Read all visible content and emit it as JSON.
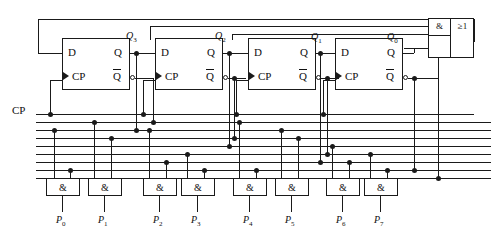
{
  "diagram": {
    "clock_label": "CP",
    "flipflops": [
      {
        "name": "ff-q3",
        "d_label": "D",
        "q_label": "Q",
        "cp_label": "CP",
        "qbar_label": "Q",
        "output_label": "Q",
        "output_sub": "3",
        "x": 62,
        "y": 38,
        "w": 68,
        "h": 52
      },
      {
        "name": "ff-q2",
        "d_label": "D",
        "q_label": "Q",
        "cp_label": "CP",
        "qbar_label": "Q",
        "output_label": "Q",
        "output_sub": "2",
        "x": 155,
        "y": 38,
        "w": 68,
        "h": 52
      },
      {
        "name": "ff-q1",
        "d_label": "D",
        "q_label": "Q",
        "cp_label": "CP",
        "qbar_label": "Q",
        "output_label": "Q",
        "output_sub": "1",
        "x": 248,
        "y": 38,
        "w": 68,
        "h": 52
      },
      {
        "name": "ff-q0",
        "d_label": "D",
        "q_label": "Q",
        "cp_label": "CP",
        "qbar_label": "Q",
        "output_label": "Q",
        "output_sub": "0",
        "x": 335,
        "y": 38,
        "w": 68,
        "h": 52
      }
    ],
    "feedback_gate": {
      "and_symbol": "&",
      "or_symbol": "≥1",
      "x": 428,
      "y": 18,
      "w": 46,
      "h": 40
    },
    "decoder_gates": [
      {
        "symbol": "&",
        "output_label": "P",
        "output_sub": "0",
        "x": 46,
        "y": 178,
        "w": 34,
        "h": 18
      },
      {
        "symbol": "&",
        "output_label": "P",
        "output_sub": "1",
        "x": 88,
        "y": 178,
        "w": 34,
        "h": 18
      },
      {
        "symbol": "&",
        "output_label": "P",
        "output_sub": "2",
        "x": 143,
        "y": 178,
        "w": 34,
        "h": 18
      },
      {
        "symbol": "&",
        "output_label": "P",
        "output_sub": "3",
        "x": 181,
        "y": 178,
        "w": 34,
        "h": 18
      },
      {
        "symbol": "&",
        "output_label": "P",
        "output_sub": "4",
        "x": 233,
        "y": 178,
        "w": 34,
        "h": 18
      },
      {
        "symbol": "&",
        "output_label": "P",
        "output_sub": "5",
        "x": 275,
        "y": 178,
        "w": 34,
        "h": 18
      },
      {
        "symbol": "&",
        "output_label": "P",
        "output_sub": "6",
        "x": 326,
        "y": 178,
        "w": 34,
        "h": 18
      },
      {
        "symbol": "&",
        "output_label": "P",
        "output_sub": "7",
        "x": 364,
        "y": 178,
        "w": 34,
        "h": 18
      }
    ],
    "colors": {
      "wire": "#1a1a1a",
      "background": "#ffffff",
      "text": "#101010"
    }
  }
}
